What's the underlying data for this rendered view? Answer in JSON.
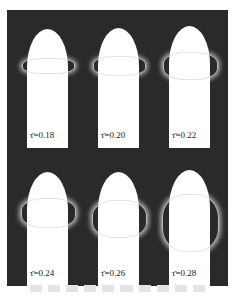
{
  "figure": {
    "panels": [
      {
        "label": "τ̄=0.18"
      },
      {
        "label": "τ̄=0.20"
      },
      {
        "label": "τ̄=0.22"
      },
      {
        "label": "τ̄=0.24"
      },
      {
        "label": "τ̄=0.26"
      },
      {
        "label": "τ̄=0.28"
      }
    ],
    "colors": {
      "background": "#2a2a2a",
      "body": "#ffffff"
    }
  }
}
